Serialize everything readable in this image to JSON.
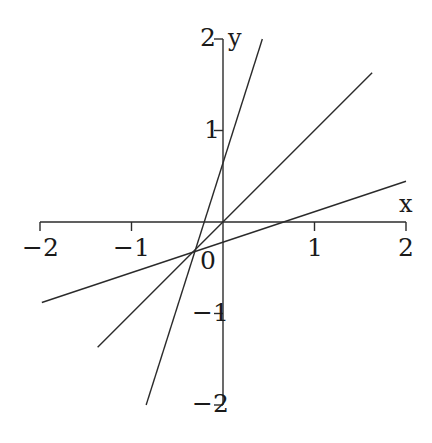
{
  "chart_data": {
    "type": "line",
    "title": "",
    "xlabel": "x",
    "ylabel": "y",
    "xlim": [
      -2,
      2
    ],
    "ylim": [
      -2,
      2
    ],
    "grid": false,
    "legend": false,
    "xticks": [
      -2,
      -1,
      0,
      1,
      2
    ],
    "yticks": [
      -2,
      -1,
      0,
      1,
      2
    ],
    "xtick_labels": [
      "−2",
      "−1",
      "0",
      "1",
      "2"
    ],
    "ytick_labels": [
      "−2",
      "−1",
      "0",
      "1",
      "2"
    ],
    "common_intersection": [
      -0.333,
      -0.333
    ],
    "series": [
      {
        "name": "steep-line",
        "slope": 3,
        "intercept": 0.7667,
        "x": [
          -0.84,
          0.43
        ],
        "y": [
          -2.0,
          2.0
        ]
      },
      {
        "name": "medium-line",
        "slope": 1,
        "intercept": 0,
        "x": [
          -1.37,
          1.63
        ],
        "y": [
          -1.37,
          1.63
        ]
      },
      {
        "name": "shallow-line",
        "slope": 0.3333,
        "intercept": -0.2222,
        "x": [
          -1.98,
          2.0
        ],
        "y": [
          -0.88,
          0.445
        ]
      }
    ]
  },
  "axes": {
    "x_axis_label": "x",
    "y_axis_label": "y",
    "origin_label": "0",
    "x_ticks": [
      {
        "value": -2,
        "label": "−2",
        "px": 40,
        "label_x": 22,
        "label_y": 235
      },
      {
        "value": -1,
        "label": "−1",
        "px": 131,
        "label_x": 113,
        "label_y": 235
      },
      {
        "value": 1,
        "label": "1",
        "px": 314,
        "label_x": 307,
        "label_y": 235
      },
      {
        "value": 2,
        "label": "2",
        "px": 405,
        "label_x": 398,
        "label_y": 235
      }
    ],
    "y_ticks": [
      {
        "value": 2,
        "label": "2",
        "px": 38,
        "label_x": 200,
        "label_y": 25
      },
      {
        "value": 1,
        "label": "1",
        "px": 130,
        "label_x": 204,
        "label_y": 117
      },
      {
        "value": -1,
        "label": "−1",
        "px": 313,
        "label_x": 192,
        "label_y": 300
      },
      {
        "value": -2,
        "label": "−2",
        "px": 404,
        "label_x": 192,
        "label_y": 391
      }
    ],
    "origin_label_x": 200,
    "origin_label_y": 248,
    "x_name_x": 399,
    "x_name_y": 192,
    "y_name_x": 228,
    "y_name_y": 26
  },
  "colors": {
    "axis": "#2b2b2b",
    "line": "#2b2b2b",
    "text": "#1a1a1a",
    "background": "#ffffff"
  },
  "geometry": {
    "origin_px_x": 223,
    "origin_px_y": 222,
    "unit_px_x": 91.5,
    "unit_px_y": 91.5,
    "tick_length": 9,
    "stroke_width": 1.4
  }
}
